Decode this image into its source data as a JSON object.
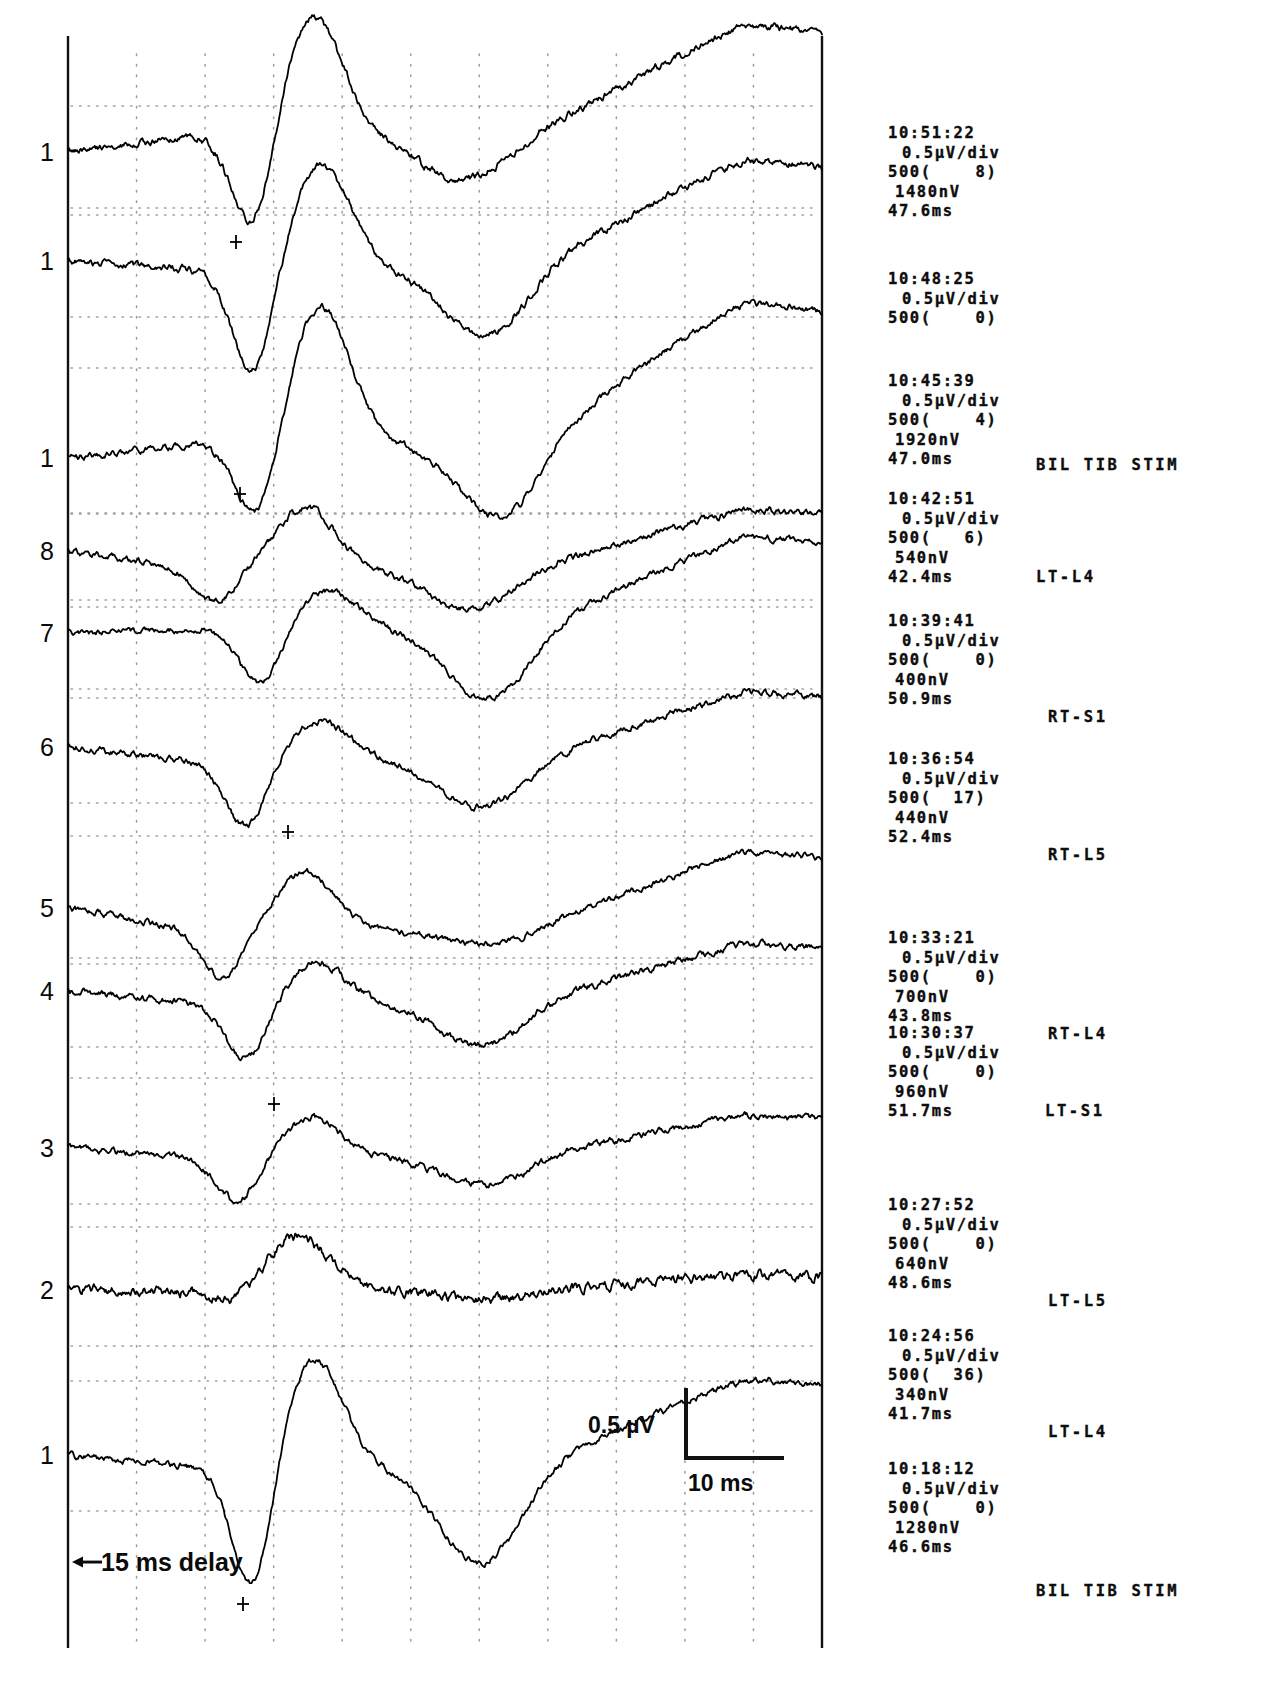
{
  "figure": {
    "kind": "ssep-trace-stack",
    "background_color": "#ffffff",
    "trace_color": "#000000",
    "grid_color": "#8a8a8a",
    "axis_color": "#111111"
  },
  "axes": {
    "left_axis_x": 68,
    "right_axis_x": 822,
    "top_y": 36,
    "bottom_y": 1648,
    "grid_columns": 11,
    "grid_dotted": true
  },
  "scale": {
    "amplitude_label": "0.5 µV",
    "time_label": "10 ms",
    "delay_label": "15 ms delay",
    "delay_arrow": "◀"
  },
  "channel_numbers": [
    {
      "label": "1",
      "y": 152
    },
    {
      "label": "1",
      "y": 261
    },
    {
      "label": "1",
      "y": 458
    },
    {
      "label": "8",
      "y": 551
    },
    {
      "label": "7",
      "y": 633
    },
    {
      "label": "6",
      "y": 747
    },
    {
      "label": "5",
      "y": 908
    },
    {
      "label": "4",
      "y": 991
    },
    {
      "label": "3",
      "y": 1148
    },
    {
      "label": "2",
      "y": 1290
    },
    {
      "label": "1",
      "y": 1455
    }
  ],
  "annotation_blocks": [
    {
      "time": "10:51:22",
      "sensitivity": "0.5µV/div",
      "sweeps": "500(    8)",
      "amplitude": "1480nV",
      "latency": "47.6ms",
      "site": "",
      "site_x": 0,
      "site_y": 0,
      "top": 124,
      "left": 28
    },
    {
      "time": "10:48:25",
      "sensitivity": "0.5µV/div",
      "sweeps": "500(    0)",
      "amplitude": "",
      "latency": "",
      "site": "",
      "site_x": 0,
      "site_y": 0,
      "top": 270,
      "left": 28
    },
    {
      "time": "10:45:39",
      "sensitivity": "0.5µV/div",
      "sweeps": "500(    4)",
      "amplitude": "1920nV",
      "latency": "47.0ms",
      "site": "BIL TIB STIM",
      "site_x": 148,
      "site_y": 84,
      "top": 372,
      "left": 28
    },
    {
      "time": "10:42:51",
      "sensitivity": "0.5µV/div",
      "sweeps": "500(   6)",
      "amplitude": "540nV",
      "latency": "42.4ms",
      "site": "LT-L4",
      "site_x": 148,
      "site_y": 78,
      "top": 490,
      "left": 28
    },
    {
      "time": "10:39:41",
      "sensitivity": "0.5µV/div",
      "sweeps": "500(    0)",
      "amplitude": "400nV",
      "latency": "50.9ms",
      "site": "RT-S1",
      "site_x": 160,
      "site_y": 96,
      "top": 612,
      "left": 28
    },
    {
      "time": "10:36:54",
      "sensitivity": "0.5µV/div",
      "sweeps": "500(  17)",
      "amplitude": "440nV",
      "latency": "52.4ms",
      "site": "RT-L5",
      "site_x": 160,
      "site_y": 96,
      "top": 750,
      "left": 28
    },
    {
      "time": "10:33:21",
      "sensitivity": "0.5µV/div",
      "sweeps": "500(    0)",
      "amplitude": "700nV",
      "latency": "43.8ms",
      "site": "RT-L4",
      "site_x": 160,
      "site_y": 96,
      "top": 929,
      "left": 28
    },
    {
      "time": "10:30:37",
      "sensitivity": "0.5µV/div",
      "sweeps": "500(    0)",
      "amplitude": "960nV",
      "latency": "51.7ms",
      "site": "LT-S1",
      "site_x": 157,
      "site_y": 78,
      "top": 1024,
      "left": 28
    },
    {
      "time": "10:27:52",
      "sensitivity": "0.5µV/div",
      "sweeps": "500(    0)",
      "amplitude": "640nV",
      "latency": "48.6ms",
      "site": "LT-L5",
      "site_x": 160,
      "site_y": 96,
      "top": 1196,
      "left": 28
    },
    {
      "time": "10:24:56",
      "sensitivity": "0.5µV/div",
      "sweeps": "500(  36)",
      "amplitude": "340nV",
      "latency": "41.7ms",
      "site": "LT-L4",
      "site_x": 160,
      "site_y": 96,
      "top": 1327,
      "left": 28
    },
    {
      "time": "10:18:12",
      "sensitivity": "0.5µV/div",
      "sweeps": "500(    0)",
      "amplitude": "1280nV",
      "latency": "46.6ms",
      "site": "BIL TIB STIM",
      "site_x": 148,
      "site_y": 122,
      "top": 1460,
      "left": 28
    }
  ],
  "traces": [
    {
      "name": "trace-1",
      "baseline": 152,
      "seed": 11,
      "pre_slope": -16,
      "neg_depth": 96,
      "neg_center": 0.245,
      "pos_height": -120,
      "pos_center": 0.325,
      "late_dip": 44,
      "late_center": 0.52,
      "tail_rise": -94,
      "noise": 3.4
    },
    {
      "name": "trace-2",
      "baseline": 261,
      "seed": 23,
      "pre_slope": 8,
      "neg_depth": 108,
      "neg_center": 0.245,
      "pos_height": -104,
      "pos_center": 0.335,
      "late_dip": 66,
      "late_center": 0.55,
      "tail_rise": -92,
      "noise": 3.2
    },
    {
      "name": "trace-3",
      "baseline": 458,
      "seed": 37,
      "pre_slope": -14,
      "neg_depth": 78,
      "neg_center": 0.25,
      "pos_height": -138,
      "pos_center": 0.335,
      "late_dip": 72,
      "late_center": 0.57,
      "tail_rise": -120,
      "noise": 3.0
    },
    {
      "name": "trace-4",
      "baseline": 551,
      "seed": 51,
      "pre_slope": 18,
      "neg_depth": 34,
      "neg_center": 0.195,
      "pos_height": -62,
      "pos_center": 0.315,
      "late_dip": 40,
      "late_center": 0.53,
      "tail_rise": -50,
      "noise": 3.0
    },
    {
      "name": "trace-5",
      "baseline": 633,
      "seed": 67,
      "pre_slope": -4,
      "neg_depth": 56,
      "neg_center": 0.255,
      "pos_height": -38,
      "pos_center": 0.345,
      "late_dip": 70,
      "late_center": 0.555,
      "tail_rise": -78,
      "noise": 2.8
    },
    {
      "name": "trace-6",
      "baseline": 747,
      "seed": 83,
      "pre_slope": 14,
      "neg_depth": 66,
      "neg_center": 0.235,
      "pos_height": -40,
      "pos_center": 0.335,
      "late_dip": 46,
      "late_center": 0.545,
      "tail_rise": -58,
      "noise": 3.0
    },
    {
      "name": "trace-7",
      "baseline": 908,
      "seed": 97,
      "pre_slope": 22,
      "neg_depth": 48,
      "neg_center": 0.205,
      "pos_height": -58,
      "pos_center": 0.315,
      "late_dip": 14,
      "late_center": 0.545,
      "tail_rise": -66,
      "noise": 2.8
    },
    {
      "name": "trace-8",
      "baseline": 991,
      "seed": 113,
      "pre_slope": 12,
      "neg_depth": 58,
      "neg_center": 0.235,
      "pos_height": -40,
      "pos_center": 0.33,
      "late_dip": 42,
      "late_center": 0.545,
      "tail_rise": -50,
      "noise": 3.2
    },
    {
      "name": "trace-9",
      "baseline": 1148,
      "seed": 131,
      "pre_slope": 10,
      "neg_depth": 44,
      "neg_center": 0.225,
      "pos_height": -40,
      "pos_center": 0.325,
      "late_dip": 26,
      "late_center": 0.55,
      "tail_rise": -36,
      "noise": 3.0
    },
    {
      "name": "trace-10",
      "baseline": 1290,
      "seed": 149,
      "pre_slope": 0,
      "neg_depth": 12,
      "neg_center": 0.215,
      "pos_height": -54,
      "pos_center": 0.305,
      "late_dip": 10,
      "late_center": 0.555,
      "tail_rise": -12,
      "noise": 4.6
    },
    {
      "name": "trace-11",
      "baseline": 1455,
      "seed": 167,
      "pre_slope": 12,
      "neg_depth": 128,
      "neg_center": 0.245,
      "pos_height": -108,
      "pos_center": 0.325,
      "late_dip": 96,
      "late_center": 0.545,
      "tail_rise": -74,
      "noise": 3.0
    }
  ],
  "chart_data": {
    "type": "line",
    "title": "",
    "xlabel": "time (ms)",
    "ylabel": "amplitude (µV)",
    "x_scale_bar_ms": 10,
    "y_scale_bar_uv": 0.5,
    "pre_stimulus_delay_ms": 15,
    "sweep_count_nominal": 500,
    "sensitivity_uv_per_div": 0.5,
    "series": [
      {
        "name": "10:51:22",
        "channel": "1",
        "amplitude_nV": 1480,
        "latency_ms": 47.6,
        "sweeps": 500,
        "rejected": 8,
        "site": ""
      },
      {
        "name": "10:48:25",
        "channel": "1",
        "amplitude_nV": null,
        "latency_ms": null,
        "sweeps": 500,
        "rejected": 0,
        "site": ""
      },
      {
        "name": "10:45:39",
        "channel": "1",
        "amplitude_nV": 1920,
        "latency_ms": 47.0,
        "sweeps": 500,
        "rejected": 4,
        "site": "BIL TIB STIM"
      },
      {
        "name": "10:42:51",
        "channel": "8",
        "amplitude_nV": 540,
        "latency_ms": 42.4,
        "sweeps": 500,
        "rejected": 6,
        "site": "LT-L4"
      },
      {
        "name": "10:39:41",
        "channel": "7",
        "amplitude_nV": 400,
        "latency_ms": 50.9,
        "sweeps": 500,
        "rejected": 0,
        "site": "RT-S1"
      },
      {
        "name": "10:36:54",
        "channel": "6",
        "amplitude_nV": 440,
        "latency_ms": 52.4,
        "sweeps": 500,
        "rejected": 17,
        "site": "RT-L5"
      },
      {
        "name": "10:33:21",
        "channel": "5",
        "amplitude_nV": 700,
        "latency_ms": 43.8,
        "sweeps": 500,
        "rejected": 0,
        "site": "RT-L4"
      },
      {
        "name": "10:30:37",
        "channel": "4",
        "amplitude_nV": 960,
        "latency_ms": 51.7,
        "sweeps": 500,
        "rejected": 0,
        "site": "LT-S1"
      },
      {
        "name": "10:27:52",
        "channel": "3",
        "amplitude_nV": 640,
        "latency_ms": 48.6,
        "sweeps": 500,
        "rejected": 0,
        "site": "LT-L5"
      },
      {
        "name": "10:24:56",
        "channel": "2",
        "amplitude_nV": 340,
        "latency_ms": 41.7,
        "sweeps": 500,
        "rejected": 36,
        "site": "LT-L4"
      },
      {
        "name": "10:18:12",
        "channel": "1",
        "amplitude_nV": 1280,
        "latency_ms": 46.6,
        "sweeps": 500,
        "rejected": 0,
        "site": "BIL TIB STIM"
      }
    ],
    "grid": true,
    "legend": "none"
  }
}
